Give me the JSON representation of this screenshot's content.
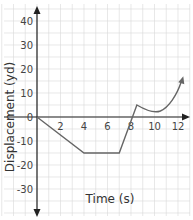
{
  "chart_data": {
    "type": "line",
    "title": "",
    "xlabel": "Time (s)",
    "ylabel": "Displacement (yd)",
    "xlim": [
      -2.5,
      13.5
    ],
    "ylim": [
      -40,
      42
    ],
    "x_ticks": [
      2,
      4,
      6,
      8,
      10,
      12
    ],
    "y_ticks": [
      40,
      30,
      20,
      10,
      0,
      -10,
      -20,
      -30
    ],
    "grid": true,
    "legend": null,
    "series": [
      {
        "name": "displacement",
        "points": [
          [
            0,
            0
          ],
          [
            4,
            -15
          ],
          [
            7,
            -15
          ],
          [
            8.5,
            5
          ],
          [
            9.5,
            3
          ],
          [
            10.5,
            3
          ],
          [
            11.5,
            7
          ],
          [
            12.3,
            15
          ]
        ],
        "color": "#666666",
        "end_arrow": true
      }
    ]
  },
  "labels": {
    "x_axis": "Time (s)",
    "y_axis": "Displacement (yd)",
    "x_tick_labels": [
      "2",
      "4",
      "6",
      "8",
      "10",
      "12"
    ],
    "y_tick_labels": [
      "40",
      "30",
      "20",
      "10",
      "0",
      "-10",
      "-20",
      "-30"
    ]
  },
  "colors": {
    "grid": "#d8d8d8",
    "axis": "#222222",
    "curve": "#666666"
  }
}
